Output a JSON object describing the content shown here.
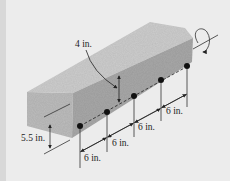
{
  "diagram": {
    "labels": {
      "tendon_offset": "4 in.",
      "height": "5.5 in.",
      "spacing_1": "6 in.",
      "spacing_2": "6 in.",
      "spacing_3": "6 in.",
      "spacing_4": "6 in."
    },
    "colors": {
      "background": "#ececec",
      "beam_top": "#c9c9c9",
      "beam_front": "#a9a9a9",
      "beam_end": "#bababa",
      "bolt": "#111111",
      "line": "#222222"
    },
    "bolt_count": 5
  }
}
